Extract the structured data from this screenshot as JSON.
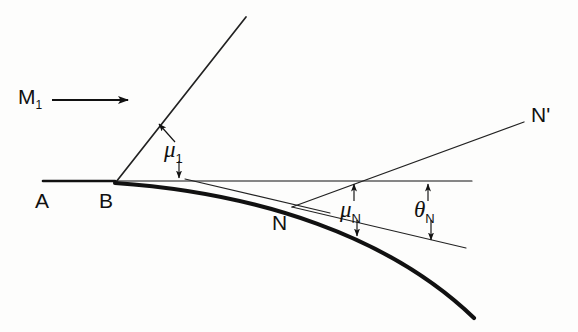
{
  "figure": {
    "background_color": "#fdfdfc",
    "ink_color": "#111111"
  },
  "labels": {
    "mach_number": "M",
    "mach_number_sub": "1",
    "point_a": "A",
    "point_b": "B",
    "point_n": "N",
    "point_n_prime": "N",
    "point_n_prime_mark": "'",
    "mu_1": "μ",
    "mu_1_sub": "1",
    "mu_n": "μ",
    "mu_n_sub": "N",
    "theta_n": "θ",
    "theta_n_sub": "N"
  },
  "geometry": {
    "baseline": {
      "x1": 43,
      "y1": 181,
      "x2": 472,
      "y2": 181
    },
    "flow_arrow": {
      "x1": 52,
      "y1": 100,
      "x2": 132,
      "y2": 100
    },
    "mach_line_b": {
      "x1": 116,
      "y1": 182,
      "x2": 246,
      "y2": 17
    },
    "mach_line_n_prime": {
      "x1": 292,
      "y1": 207,
      "x2": 524,
      "y2": 122
    },
    "tangent_line_n": {
      "x1": 292,
      "y1": 207,
      "x2": 466,
      "y2": 248
    },
    "thin_chord_b": {
      "x1": 185,
      "y1": 179,
      "x2": 330,
      "y2": 213
    },
    "wall_curve": {
      "start": {
        "x": 115,
        "y": 183
      },
      "control_1": {
        "x": 260,
        "y": 193
      },
      "control_2": {
        "x": 390,
        "y": 237
      },
      "end": {
        "x": 474,
        "y": 318
      }
    }
  },
  "annotations": {
    "mu_1_pointer_up": {
      "x1": 173,
      "y1": 142,
      "x2": 158,
      "y2": 123
    },
    "mu_1_pointer_down": {
      "x1": 178,
      "y1": 160,
      "x2": 178,
      "y2": 180
    },
    "mu_n_pointer_up": {
      "x1": 354,
      "y1": 201,
      "x2": 354,
      "y2": 182
    },
    "mu_n_pointer_down": {
      "x1": 357,
      "y1": 219,
      "x2": 357,
      "y2": 237
    },
    "theta_n_pointer_up": {
      "x1": 428,
      "y1": 201,
      "x2": 428,
      "y2": 182
    },
    "theta_n_pointer_down": {
      "x1": 431,
      "y1": 219,
      "x2": 431,
      "y2": 241
    }
  }
}
